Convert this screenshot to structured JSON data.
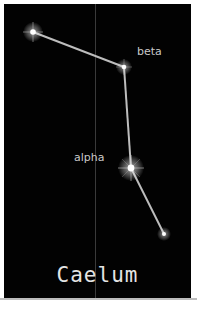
{
  "constellation": {
    "name": "Caelum",
    "background_color": "#020202",
    "line_color": "#c8c8c8",
    "stars": [
      {
        "id": "star-1",
        "label": "",
        "x": 29,
        "y": 28,
        "size": 7
      },
      {
        "id": "beta",
        "label": "beta",
        "x": 120,
        "y": 63,
        "size": 6
      },
      {
        "id": "alpha",
        "label": "alpha",
        "x": 127,
        "y": 164,
        "size": 9
      },
      {
        "id": "star-4",
        "label": "",
        "x": 160,
        "y": 230,
        "size": 5
      }
    ],
    "labels": {
      "beta": "beta",
      "alpha": "alpha"
    }
  }
}
